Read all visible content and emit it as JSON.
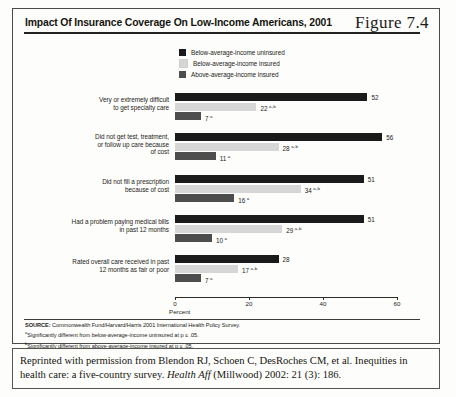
{
  "figure": {
    "title": "Impact Of Insurance Coverage On Low-Income Americans, 2001",
    "number": "Figure 7.4"
  },
  "legend": {
    "items": [
      {
        "label": "Below-average-income uninsured",
        "color": "#1a1a1a"
      },
      {
        "label": "Below-average-income insured",
        "color": "#d6d6d6"
      },
      {
        "label": "Above-average-income insured",
        "color": "#4d4d4d"
      }
    ]
  },
  "axis": {
    "ticks": [
      "0",
      "20",
      "40",
      "60"
    ],
    "title": "Percent"
  },
  "notes": [
    {
      "bold": "SOURCE:",
      "text": " Commonwealth Fund/Harvard/Harris 2001 International Health Policy Survey."
    },
    {
      "marker": "a",
      "text": "Significantly different from below-average-income uninsured at p ≤ .05."
    },
    {
      "marker": "b",
      "text": "Significantly different from above-average-income insured at p ≤ .05."
    }
  ],
  "caption": {
    "line1": "Reprinted with permission from Blendon RJ, Schoen C, DesRoches CM, et al. Inequities",
    "line2_pre": "in health care: a five-country survey. ",
    "line2_italic": "Health Aff",
    "line2_post": " (Millwood) 2002: 21 (3): 186."
  },
  "chart_data": {
    "type": "bar",
    "orientation": "horizontal",
    "title": "Impact Of Insurance Coverage On Low-Income Americans, 2001",
    "xlabel": "Percent",
    "ylabel": "",
    "xlim": [
      0,
      60
    ],
    "xticks": [
      0,
      20,
      40,
      60
    ],
    "grid": false,
    "legend_position": "top-center",
    "categories": [
      "Very or extremely difficult to get specialty care",
      "Did not get test, treatment, or follow up care because of cost",
      "Did not fill a prescription because of cost",
      "Had a problem paying medical bills in past 12 months",
      "Rated overall care received in past 12 months as fair or poor"
    ],
    "category_lines": [
      [
        "Very or extremely difficult",
        "to get specialty care"
      ],
      [
        "Did not get test, treatment,",
        "or follow up care because",
        "of cost"
      ],
      [
        "Did not fill a prescription",
        "because of cost"
      ],
      [
        "Had a problem paying medical bills",
        "in past 12 months"
      ],
      [
        "Rated overall care received in past",
        "12 months as fair or poor"
      ]
    ],
    "series": [
      {
        "name": "Below-average-income uninsured",
        "color": "#1a1a1a",
        "values": [
          52,
          56,
          51,
          51,
          28
        ],
        "labels": [
          "52",
          "56",
          "51",
          "51",
          "28"
        ],
        "markers": [
          "",
          "",
          "",
          "",
          ""
        ]
      },
      {
        "name": "Below-average-income insured",
        "color": "#d6d6d6",
        "values": [
          22,
          28,
          34,
          29,
          17
        ],
        "labels": [
          "22",
          "28",
          "34",
          "29",
          "17"
        ],
        "markers": [
          "a,b",
          "a,b",
          "a,b",
          "a,b",
          "a,b"
        ]
      },
      {
        "name": "Above-average-income insured",
        "color": "#4d4d4d",
        "values": [
          7,
          11,
          16,
          10,
          7
        ],
        "labels": [
          "7",
          "11",
          "16",
          "10",
          "7"
        ],
        "markers": [
          "a",
          "a",
          "a",
          "a",
          "a"
        ]
      }
    ]
  }
}
